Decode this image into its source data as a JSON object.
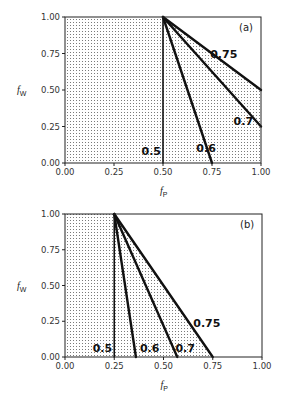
{
  "chart_data": [
    {
      "type": "line",
      "panel": "(a)",
      "title": "",
      "xlabel": "f_P",
      "ylabel": "f_W",
      "xlim": [
        0,
        1
      ],
      "ylim": [
        0,
        1
      ],
      "xticks": [
        "0.00",
        "0.25",
        "0.50",
        "0.75",
        "1.00"
      ],
      "yticks": [
        "0.00",
        "0.25",
        "0.50",
        "0.75",
        "1.00"
      ],
      "grid": false,
      "shaded_region": "stippled area left of/below the 0.75 line",
      "series": [
        {
          "name": "0.5",
          "x": [
            0.5,
            0.5
          ],
          "y": [
            1.0,
            0.0
          ],
          "label_pos": [
            0.44,
            0.08
          ]
        },
        {
          "name": "0.6",
          "x": [
            0.5,
            0.75
          ],
          "y": [
            1.0,
            0.0
          ],
          "label_pos": [
            0.72,
            0.1
          ]
        },
        {
          "name": "0.7",
          "x": [
            0.5,
            1.0
          ],
          "y": [
            1.0,
            0.25
          ],
          "label_pos": [
            0.91,
            0.29
          ]
        },
        {
          "name": "0.75",
          "x": [
            0.5,
            1.0
          ],
          "y": [
            1.0,
            0.5
          ],
          "label_pos": [
            0.81,
            0.75
          ]
        }
      ]
    },
    {
      "type": "line",
      "panel": "(b)",
      "title": "",
      "xlabel": "f_P",
      "ylabel": "f_W",
      "xlim": [
        0,
        1
      ],
      "ylim": [
        0,
        1
      ],
      "xticks": [
        "0.00",
        "0.25",
        "0.50",
        "0.75",
        "1.00"
      ],
      "yticks": [
        "0.00",
        "0.25",
        "0.50",
        "0.75",
        "1.00"
      ],
      "grid": false,
      "shaded_region": "stippled area left of/below the 0.75 line",
      "series": [
        {
          "name": "0.5",
          "x": [
            0.25,
            0.25
          ],
          "y": [
            1.0,
            0.0
          ],
          "label_pos": [
            0.19,
            0.06
          ]
        },
        {
          "name": "0.6",
          "x": [
            0.25,
            0.36
          ],
          "y": [
            1.0,
            0.0
          ],
          "label_pos": [
            0.43,
            0.06
          ]
        },
        {
          "name": "0.7",
          "x": [
            0.25,
            0.57
          ],
          "y": [
            1.0,
            0.0
          ],
          "label_pos": [
            0.61,
            0.06
          ]
        },
        {
          "name": "0.75",
          "x": [
            0.25,
            0.75
          ],
          "y": [
            1.0,
            0.0
          ],
          "label_pos": [
            0.72,
            0.24
          ]
        }
      ]
    }
  ],
  "panels": [
    {
      "tag": "(a)",
      "xlabel_main": "f",
      "xlabel_sub": "P",
      "ylabel_main": "f",
      "ylabel_sub": "W"
    },
    {
      "tag": "(b)",
      "xlabel_main": "f",
      "xlabel_sub": "P",
      "ylabel_main": "f",
      "ylabel_sub": "W"
    }
  ],
  "style": {
    "line_color": "#111111",
    "axis_color": "#222222",
    "stipple_color": "#6a6a6a"
  }
}
